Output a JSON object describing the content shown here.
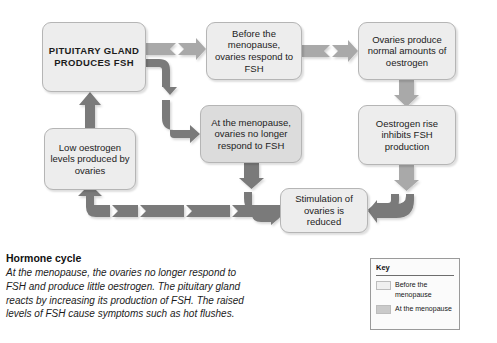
{
  "diagram": {
    "colors": {
      "arrow_light": "#a9a9a9",
      "arrow_dark": "#7a7a7a",
      "box_light_fill": "#ededed",
      "box_dark_fill": "#dcdcdc",
      "box_border": "#b5b5b5"
    },
    "nodes": [
      {
        "id": "pituitary",
        "label": "PITUITARY GLAND PRODUCES FSH"
      },
      {
        "id": "before",
        "label": "Before the menopause, ovaries respond to FSH"
      },
      {
        "id": "ovaries_normal",
        "label": "Ovaries produce normal amounts of oestrogen"
      },
      {
        "id": "at_menopause",
        "label": "At the menopause, ovaries no longer respond to FSH"
      },
      {
        "id": "oestrogen_rise",
        "label": "Oestrogen rise inhibits FSH production"
      },
      {
        "id": "low_oestrogen",
        "label": "Low oestrogen levels produced by ovaries"
      },
      {
        "id": "stimulation",
        "label": "Stimulation of ovaries is reduced"
      }
    ]
  },
  "caption": {
    "heading": "Hormone cycle",
    "body": "At the menopause, the ovaries no longer respond to FSH and produce little oestrogen. The pituitary gland reacts by increasing its production of FSH. The raised levels of FSH cause symptoms such as hot flushes."
  },
  "key": {
    "title": "Key",
    "items": [
      {
        "swatch": "light",
        "label": "Before the menopause"
      },
      {
        "swatch": "dark",
        "label": "At the menopause"
      }
    ]
  }
}
